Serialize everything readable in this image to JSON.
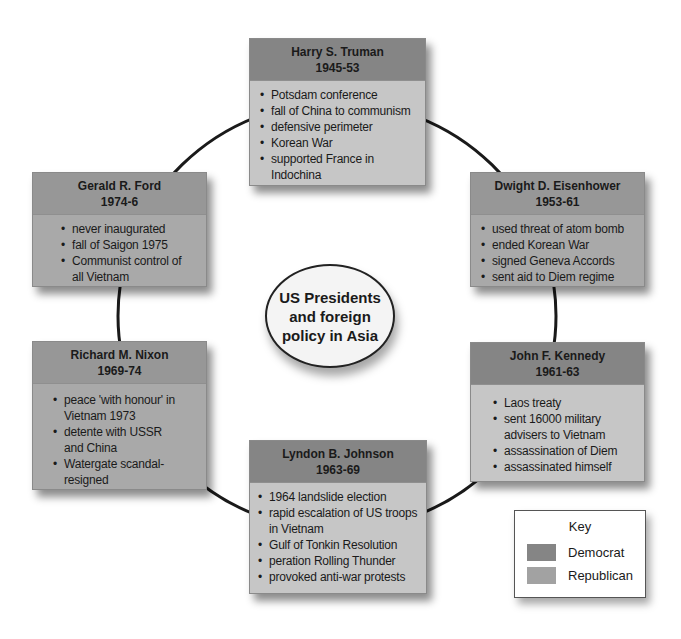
{
  "diagram": {
    "center_title": [
      "US Presidents",
      "and foreign",
      "policy in Asia"
    ],
    "colors": {
      "democrat_header": "#858585",
      "democrat_body": "#c6c6c6",
      "republican_header": "#979797",
      "republican_body": "#a9a9a9",
      "ring": "#1a1a1a"
    },
    "presidents": [
      {
        "name": "Harry S. Truman",
        "years": "1945-53",
        "party": "Democrat",
        "points": [
          "Potsdam conference",
          "fall of China to communism",
          "defensive perimeter",
          "Korean War",
          "supported France in Indochina"
        ]
      },
      {
        "name": "Dwight D. Eisenhower",
        "years": "1953-61",
        "party": "Republican",
        "points": [
          "used threat of atom bomb",
          "ended Korean War",
          "signed Geneva Accords",
          "sent aid to Diem regime"
        ]
      },
      {
        "name": "John F. Kennedy",
        "years": "1961-63",
        "party": "Democrat",
        "points": [
          "Laos treaty",
          "sent 16000 military advisers to Vietnam",
          "assassination of Diem",
          "assassinated himself"
        ]
      },
      {
        "name": "Lyndon B. Johnson",
        "years": "1963-69",
        "party": "Democrat",
        "points": [
          "1964 landslide election",
          "rapid escalation of US troops in Vietnam",
          "Gulf of Tonkin Resolution",
          "peration Rolling Thunder",
          "provoked anti-war protests"
        ]
      },
      {
        "name": "Richard M. Nixon",
        "years": "1969-74",
        "party": "Republican",
        "points": [
          "peace 'with honour' in Vietnam 1973",
          "detente with USSR and China",
          "Watergate scandal-resigned"
        ]
      },
      {
        "name": "Gerald R. Ford",
        "years": "1974-6",
        "party": "Republican",
        "points": [
          "never inaugurated",
          "fall of Saigon 1975",
          "Communist control of all Vietnam"
        ]
      }
    ],
    "key": {
      "title": "Key",
      "items": [
        {
          "label": "Democrat",
          "color": "#858585"
        },
        {
          "label": "Republican",
          "color": "#a2a2a2"
        }
      ]
    },
    "bullet_char": "•"
  }
}
